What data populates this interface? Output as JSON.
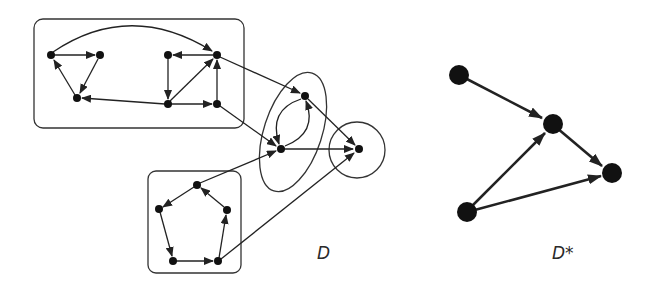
{
  "figure": {
    "colors": {
      "stroke": "#222222",
      "node": "#111111",
      "background": "#ffffff"
    }
  },
  "labels": {
    "d": "D",
    "d_star": "D*"
  },
  "graph_d": {
    "components": [
      {
        "name": "top-box",
        "shape": "rounded-rect",
        "nodes": [
          "A",
          "B",
          "C",
          "E",
          "F",
          "G",
          "H"
        ]
      },
      {
        "name": "pentagon-box",
        "shape": "rounded-rect",
        "nodes": [
          "P1",
          "P2",
          "P3",
          "P4",
          "P5"
        ]
      },
      {
        "name": "middle-ellipse",
        "shape": "ellipse",
        "nodes": [
          "M1",
          "M2"
        ]
      },
      {
        "name": "right-circle",
        "shape": "circle",
        "nodes": [
          "R"
        ]
      }
    ],
    "nodes": [
      {
        "id": "A",
        "x": 51,
        "y": 55
      },
      {
        "id": "B",
        "x": 100,
        "y": 55
      },
      {
        "id": "C",
        "x": 77,
        "y": 98
      },
      {
        "id": "E",
        "x": 168,
        "y": 55
      },
      {
        "id": "F",
        "x": 217,
        "y": 55
      },
      {
        "id": "G",
        "x": 168,
        "y": 104
      },
      {
        "id": "H",
        "x": 217,
        "y": 104
      },
      {
        "id": "P1",
        "x": 197,
        "y": 185
      },
      {
        "id": "P2",
        "x": 159,
        "y": 209
      },
      {
        "id": "P3",
        "x": 173,
        "y": 261
      },
      {
        "id": "P4",
        "x": 218,
        "y": 261
      },
      {
        "id": "P5",
        "x": 227,
        "y": 210
      },
      {
        "id": "M1",
        "x": 305,
        "y": 96
      },
      {
        "id": "M2",
        "x": 281,
        "y": 149
      },
      {
        "id": "R",
        "x": 359,
        "y": 149
      }
    ],
    "edges": [
      [
        "A",
        "B"
      ],
      [
        "B",
        "C"
      ],
      [
        "C",
        "A"
      ],
      [
        "A",
        "F"
      ],
      [
        "F",
        "E"
      ],
      [
        "E",
        "G"
      ],
      [
        "G",
        "F"
      ],
      [
        "G",
        "H"
      ],
      [
        "H",
        "F"
      ],
      [
        "G",
        "C"
      ],
      [
        "F",
        "M1"
      ],
      [
        "H",
        "M2"
      ],
      [
        "M1",
        "M2"
      ],
      [
        "M2",
        "M1"
      ],
      [
        "M1",
        "R"
      ],
      [
        "M2",
        "R"
      ],
      [
        "P1",
        "P2"
      ],
      [
        "P2",
        "P3"
      ],
      [
        "P3",
        "P4"
      ],
      [
        "P4",
        "P5"
      ],
      [
        "P5",
        "P1"
      ],
      [
        "P1",
        "M2"
      ],
      [
        "P4",
        "R"
      ]
    ]
  },
  "graph_d_star": {
    "nodes": [
      {
        "id": "S1",
        "x": 459,
        "y": 75
      },
      {
        "id": "S2",
        "x": 553,
        "y": 124
      },
      {
        "id": "S3",
        "x": 612,
        "y": 173
      },
      {
        "id": "S4",
        "x": 467,
        "y": 212
      }
    ],
    "edges": [
      [
        "S1",
        "S2"
      ],
      [
        "S2",
        "S3"
      ],
      [
        "S4",
        "S2"
      ],
      [
        "S4",
        "S3"
      ]
    ]
  }
}
